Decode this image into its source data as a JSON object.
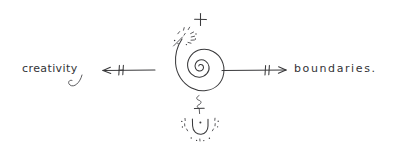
{
  "canvas": {
    "background_color": "#ffffff",
    "ink_color": "#3a3a3c",
    "width": 415,
    "height": 153
  },
  "diagram": {
    "type": "hand-drawn-sketch",
    "center_symbol": "spiral",
    "labels": {
      "left": "creativity",
      "right": "boundaries.",
      "top": "+",
      "below_spiral": "+"
    },
    "arrows": [
      {
        "name": "left-arrow",
        "direction": "left",
        "target": "creativity",
        "barrier_mark": "H"
      },
      {
        "name": "right-arrow",
        "direction": "right",
        "target": "boundaries.",
        "barrier_mark": "||"
      }
    ],
    "ornaments": [
      {
        "name": "sparkle-burst",
        "position": "top-left-of-spiral"
      },
      {
        "name": "squiggle-line",
        "position": "below-spiral"
      },
      {
        "name": "cup-glyph",
        "position": "bottom"
      },
      {
        "name": "cup-sparkles",
        "position": "around-cup"
      }
    ]
  }
}
